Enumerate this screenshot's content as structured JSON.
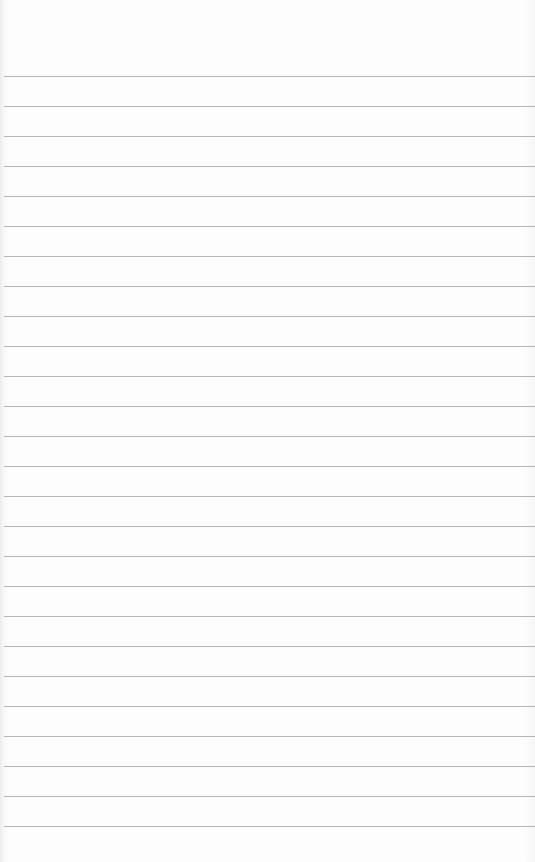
{
  "paper": {
    "type": "ruled-notepad",
    "first_line_y": 76,
    "line_spacing": 30,
    "line_count": 26,
    "line_color": "#a9a9a9",
    "background_color": "#fdfdfd"
  }
}
